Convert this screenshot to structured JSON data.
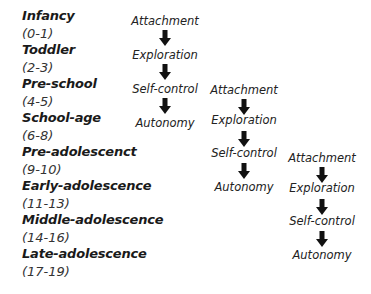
{
  "stages": [
    {
      "name": "Infancy",
      "age": "(0-1)"
    },
    {
      "name": "Toddler",
      "age": "(2-3)"
    },
    {
      "name": "Pre-school",
      "age": "(4-5)"
    },
    {
      "name": "School-age",
      "age": "(6-8)"
    },
    {
      "name": "Pre-adolescenct",
      "age": "(9-10)"
    },
    {
      "name": "Early-adolescence",
      "age": "(11-13)"
    },
    {
      "name": "Middle-adolescence",
      "age": "(14-16)"
    },
    {
      "name": "Late-adolescence",
      "age": "(17-19)"
    }
  ],
  "cycles": [
    {
      "steps": [
        "Attachment",
        "Exploration",
        "Self-control",
        "Autonomy"
      ]
    },
    {
      "steps": [
        "Attachment",
        "Exploration",
        "Self-control",
        "Autonomy"
      ]
    },
    {
      "steps": [
        "Attachment",
        "Exploration",
        "Self-control",
        "Autonomy"
      ]
    }
  ],
  "colors": {
    "text": "#1a1a1a",
    "arrow": "#111111"
  }
}
